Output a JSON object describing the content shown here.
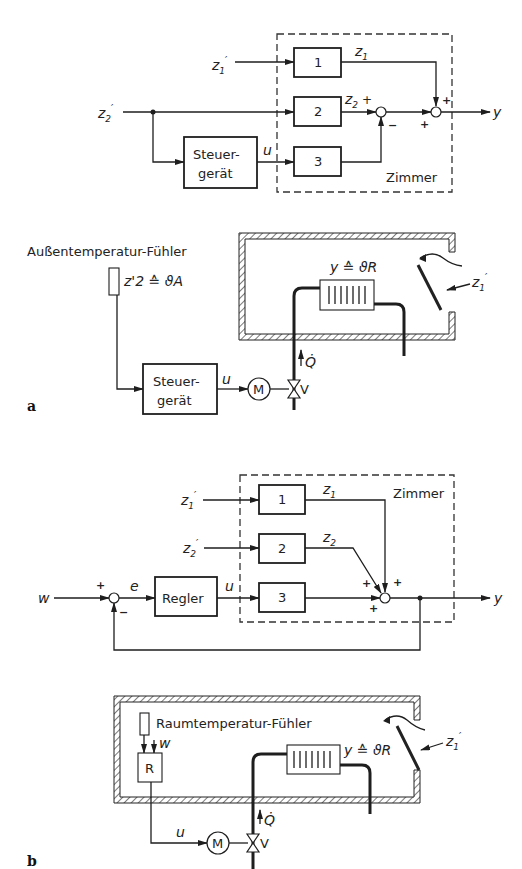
{
  "figure_a": {
    "panel_label": "a",
    "block_diagram": {
      "inputs": [
        "z'1",
        "z'2"
      ],
      "blocks": [
        "1",
        "2",
        "3"
      ],
      "controller": {
        "line1": "Steuer-",
        "line2": "gerät"
      },
      "signals": {
        "z1": "z1",
        "z2": "z2",
        "u": "u",
        "y": "y"
      },
      "summing": [
        {
          "signs": [
            "+",
            "−"
          ]
        },
        {
          "signs": [
            "+",
            "+"
          ]
        }
      ],
      "plant_label": "Zimmer"
    },
    "schematic": {
      "sensor_label": "Außentemperatur-Fühler",
      "sensor_value": "z'2 ≙ ϑA",
      "room_output": "y ≙ ϑR",
      "disturbance": "z'1",
      "controller": {
        "line1": "Steuer-",
        "line2": "gerät"
      },
      "signal_u": "u",
      "motor": "M",
      "valve": "V",
      "heat_flow": "Q̇"
    }
  },
  "figure_b": {
    "panel_label": "b",
    "block_diagram": {
      "reference": "w",
      "error": "e",
      "controller": "Regler",
      "inputs": [
        "z'1",
        "z'2"
      ],
      "blocks": [
        "1",
        "2",
        "3"
      ],
      "signals": {
        "z1": "z1",
        "z2": "z2",
        "u": "u",
        "y": "y"
      },
      "summing": [
        {
          "signs": [
            "+",
            "−"
          ]
        },
        {
          "signs": [
            "+",
            "+",
            "+"
          ]
        }
      ],
      "plant_label": "Zimmer"
    },
    "schematic": {
      "sensor_label": "Raumtemperatur-Fühler",
      "reference": "w",
      "controller": "R",
      "room_output": "y ≙ ϑR",
      "disturbance": "z'1",
      "signal_u": "u",
      "motor": "M",
      "valve": "V",
      "heat_flow": "Q̇"
    }
  }
}
